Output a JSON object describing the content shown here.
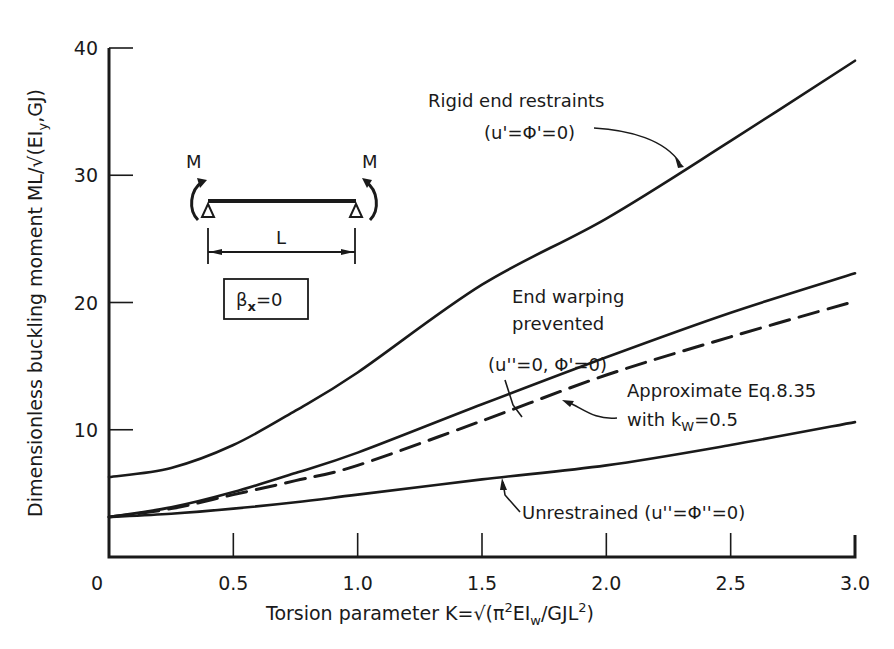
{
  "chart_data": {
    "type": "line",
    "title": "",
    "xlabel": "Torsion parameter K=√(π²EIw/GJL²)",
    "ylabel": "Dimensionless buckling moment ML/√(EIyGJ)",
    "xlim": [
      0,
      3.0
    ],
    "ylim": [
      0,
      40
    ],
    "x_ticks": [
      "0",
      "0.5",
      "1.0",
      "1.5",
      "2.0",
      "2.5",
      "3.0"
    ],
    "y_ticks": [
      "0",
      "10",
      "20",
      "30",
      "40"
    ],
    "grid": false,
    "legend": "none (inline annotations)",
    "x": [
      0,
      0.25,
      0.5,
      0.75,
      1.0,
      1.5,
      2.0,
      2.5,
      3.0
    ],
    "series": [
      {
        "name": "Rigid end restraints (u'=Φ'=0)",
        "style": "solid",
        "values": [
          6.28,
          7.0,
          8.8,
          11.5,
          14.5,
          21.4,
          26.6,
          32.7,
          39.0
        ]
      },
      {
        "name": "End warping prevented (u''=0, Φ'=0)",
        "style": "solid",
        "values": [
          3.14,
          3.9,
          5.1,
          6.6,
          8.2,
          12.0,
          15.7,
          19.2,
          22.3
        ]
      },
      {
        "name": "Approximate Eq.8.35 with kw=0.5",
        "style": "dashed",
        "values": [
          3.14,
          3.8,
          4.9,
          6.0,
          7.2,
          10.7,
          14.3,
          17.3,
          20.1
        ]
      },
      {
        "name": "Unrestrained (u''=Φ''=0)",
        "style": "solid",
        "values": [
          3.14,
          3.4,
          3.8,
          4.3,
          4.9,
          6.1,
          7.2,
          8.8,
          10.6
        ]
      }
    ],
    "annotations": [
      {
        "text": "Rigid end restraints",
        "sub": "(u'=Φ'=0)"
      },
      {
        "text": "End warping",
        "sub": "prevented",
        "sub2": "(u''=0, Φ'=0)"
      },
      {
        "text": "Approximate Eq.8.35",
        "sub": "with kw=0.5"
      },
      {
        "text": "Unrestrained (u''=Φ''=0)"
      }
    ],
    "inset": {
      "moment_left": "M",
      "moment_right": "M",
      "span": "L",
      "boxed_label": "βx=0"
    }
  },
  "labels": {
    "xlabel_main": "Torsion parameter K=√(π",
    "xlabel_sup1": "2",
    "xlabel_mid": "EI",
    "xlabel_sub": "w",
    "xlabel_mid2": "/GJL",
    "xlabel_sup2": "2",
    "xlabel_end": ")",
    "ylabel_main": "Dimensionless buckling moment ML/√(EI",
    "ylabel_sub": "y",
    "ylabel_end": "GJ)",
    "rigid_line1": "Rigid end restraints",
    "rigid_line2": "(u'=Φ'=0)",
    "warp_line1": "End warping",
    "warp_line2": "prevented",
    "warp_line3": "(u''=0, Φ'=0)",
    "approx_line1": "Approximate Eq.8.35",
    "approx_line2a": "with k",
    "approx_line2sub": "W",
    "approx_line2b": "=0.5",
    "unres_line": "Unrestrained (u''=Φ''=0)",
    "inset_m_left": "M",
    "inset_m_right": "M",
    "inset_span": "L",
    "inset_beta": "β",
    "inset_beta_sub": "x",
    "inset_beta_end": "=0"
  }
}
